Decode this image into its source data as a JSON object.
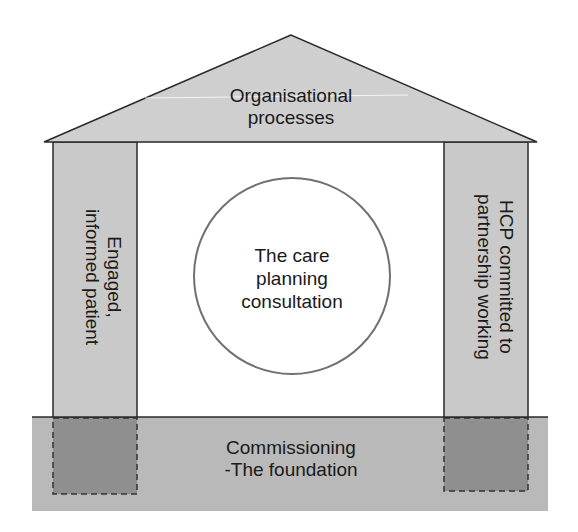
{
  "diagram": {
    "type": "house-model",
    "roof": {
      "label_line1": "Organisational",
      "label_line2": "processes"
    },
    "left_pillar": {
      "label_line1": "Engaged,",
      "label_line2": "informed patient"
    },
    "right_pillar": {
      "label_line1": "HCP committed to",
      "label_line2": "partnership working"
    },
    "center": {
      "label_line1": "The care",
      "label_line2": "planning",
      "label_line3": "consultation"
    },
    "foundation": {
      "label_line1": "Commissioning",
      "label_line2": "-The foundation"
    },
    "colors": {
      "roof_fill": "#cfcfcf",
      "pillar_fill": "#c9c9c9",
      "foundation_fill": "#b9b9b9",
      "footing_fill": "#8f8f8f",
      "stroke": "#2a2a2a",
      "circle_stroke": "#707070"
    }
  }
}
